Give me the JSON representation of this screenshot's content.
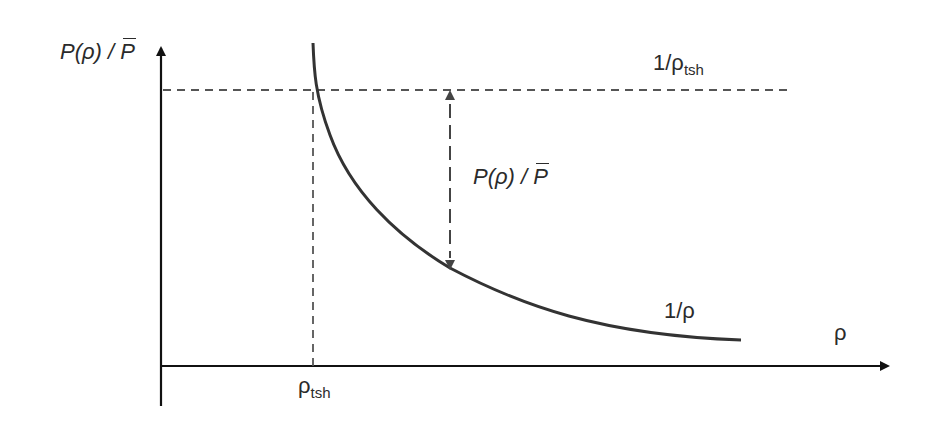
{
  "diagram": {
    "type": "curve-plot",
    "y_axis_label": {
      "prefix": "P(ρ) / ",
      "bar_symbol": "P"
    },
    "x_axis_label": "ρ",
    "threshold_x_label": {
      "base": "ρ",
      "sub": "tsh"
    },
    "threshold_y_label": {
      "base": "1/ρ",
      "sub": "tsh"
    },
    "curve_label": "1/ρ",
    "gap_label": {
      "prefix": "P(ρ) / ",
      "bar_symbol": "P"
    },
    "colors": {
      "axis": "#111111",
      "curve": "#333333",
      "dashed": "#555555",
      "text": "#2b2b2b"
    },
    "curve": {
      "function": "1/ρ",
      "description": "hyperbolic decay starting at threshold ρ_tsh"
    }
  }
}
